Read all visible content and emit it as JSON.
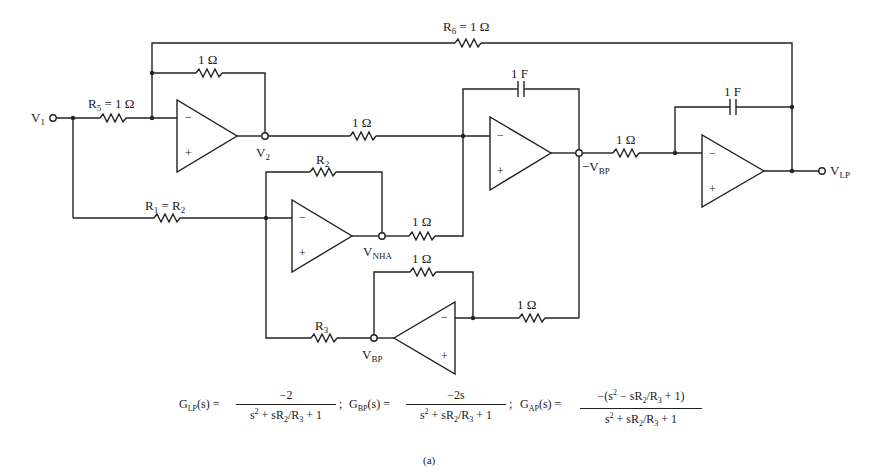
{
  "figure": {
    "caption": "(a)",
    "inputs": [
      {
        "name": "V1",
        "base": "V",
        "sub": "1"
      }
    ],
    "outputs": [
      {
        "name": "VLP",
        "base": "V",
        "sub": "LP"
      }
    ],
    "nodes": {
      "v2": {
        "base": "V",
        "sub": "2"
      },
      "vnha": {
        "base": "V",
        "sub": "NHA"
      },
      "neg_vbp": {
        "base": "−V",
        "sub": "BP"
      },
      "vbp": {
        "base": "V",
        "sub": "BP"
      }
    },
    "components": {
      "r6": {
        "type": "resistor",
        "base": "R",
        "sub": "6",
        "value": " = 1 Ω"
      },
      "r5": {
        "type": "resistor",
        "base": "R",
        "sub": "5",
        "value": " = 1 Ω"
      },
      "rf1": {
        "type": "resistor",
        "label": "1 Ω"
      },
      "r_v2": {
        "type": "resistor",
        "label": "1 Ω"
      },
      "c1": {
        "type": "capacitor",
        "label": "1 F"
      },
      "c2": {
        "type": "capacitor",
        "label": "1 F"
      },
      "r_bp": {
        "type": "resistor",
        "label": "1 Ω"
      },
      "r2": {
        "type": "resistor",
        "base": "R",
        "sub": "2"
      },
      "r1": {
        "type": "resistor",
        "base": "R",
        "sub": "1",
        "value": " = R",
        "sub2": "2"
      },
      "r_nha": {
        "type": "resistor",
        "label": "1 Ω"
      },
      "rf5": {
        "type": "resistor",
        "label": "1 Ω"
      },
      "r_in5": {
        "type": "resistor",
        "label": "1 Ω"
      },
      "r3": {
        "type": "resistor",
        "base": "R",
        "sub": "3"
      }
    },
    "opamp_signs": {
      "minus": "−",
      "plus": "+"
    },
    "equations": {
      "glp": {
        "lhs_base": "G",
        "lhs_sub": "LP",
        "lhs_tail": "(s) =",
        "num": "−2",
        "den_a": "s",
        "den_sup": "2",
        "den_b": " + sR",
        "den_sub1": "2",
        "den_c": "/R",
        "den_sub2": "3",
        "den_d": " + 1",
        "sep": ";"
      },
      "gbp": {
        "lhs_base": "G",
        "lhs_sub": "BP",
        "lhs_tail": "(s) =",
        "num": "−2s",
        "den_a": "s",
        "den_sup": "2",
        "den_b": " + sR",
        "den_sub1": "2",
        "den_c": "/R",
        "den_sub2": "3",
        "den_d": " + 1",
        "sep": ";"
      },
      "gap": {
        "lhs_base": "G",
        "lhs_sub": "AP",
        "lhs_tail": "(s) =",
        "num_a": "−(s",
        "num_sup": "2",
        "num_b": " − sR",
        "num_sub1": "2",
        "num_c": "/R",
        "num_sub2": "3",
        "num_d": " + 1)",
        "den_a": "s",
        "den_sup": "2",
        "den_b": " + sR",
        "den_sub1": "2",
        "den_c": "/R",
        "den_sub2": "3",
        "den_d": " + 1"
      }
    }
  }
}
